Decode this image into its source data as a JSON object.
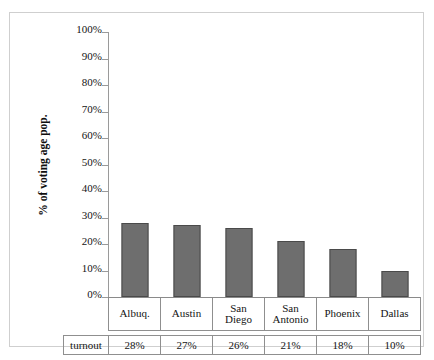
{
  "scan": {
    "top_artifact_text": ""
  },
  "axis": {
    "y_title": "% of voting age pop.",
    "y_ticks": [
      "100%",
      "90%",
      "80%",
      "70%",
      "60%",
      "50%",
      "40%",
      "30%",
      "20%",
      "10%",
      "0%"
    ]
  },
  "table": {
    "row_label": "turnout"
  },
  "colors": {
    "bar_fill": "#6e6e6e",
    "bar_stroke": "#4a4a4a",
    "axis_line": "#9a9a9a",
    "table_border": "#8f8f8f",
    "frame_border": "#cfcfcf",
    "background": "#ffffff",
    "text": "#141414"
  },
  "chart_data": {
    "type": "bar",
    "title": "",
    "subtitle": "",
    "xlabel": "",
    "ylabel": "% of voting age pop.",
    "categories": [
      "Albuq.",
      "Austin",
      "San Diego",
      "San Antonio",
      "Phoenix",
      "Dallas"
    ],
    "category_lines": [
      [
        "Albuq."
      ],
      [
        "Austin"
      ],
      [
        "San",
        "Diego"
      ],
      [
        "San",
        "Antonio"
      ],
      [
        "Phoenix"
      ],
      [
        "Dallas"
      ]
    ],
    "values": [
      28,
      27,
      26,
      21,
      18,
      10
    ],
    "value_labels": [
      "28%",
      "27%",
      "26%",
      "21%",
      "18%",
      "10%"
    ],
    "series": [
      {
        "name": "turnout",
        "values": [
          28,
          27,
          26,
          21,
          18,
          10
        ]
      }
    ],
    "ylim": [
      0,
      100
    ],
    "ytick_step": 10,
    "ytick_labels": [
      "0%",
      "10%",
      "20%",
      "30%",
      "40%",
      "50%",
      "60%",
      "70%",
      "80%",
      "90%",
      "100%"
    ],
    "grid": false,
    "legend": false,
    "units": "percent",
    "data_table_row_header": "turnout"
  }
}
